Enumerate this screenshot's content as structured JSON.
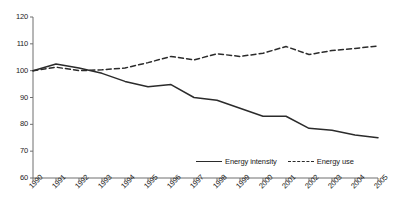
{
  "chart_data": {
    "type": "line",
    "title": "",
    "xlabel": "",
    "ylabel": "",
    "ylim": [
      60,
      120
    ],
    "ytick_values": [
      60,
      70,
      80,
      90,
      100,
      110,
      120
    ],
    "grid": false,
    "legend_position": "bottom-right",
    "categories": [
      "1990",
      "1991",
      "1992",
      "1993",
      "1994",
      "1995",
      "1996",
      "1997",
      "1998",
      "1999",
      "2000",
      "2001",
      "2002",
      "2003",
      "2004",
      "2005"
    ],
    "series": [
      {
        "name": "Energy intensity",
        "style": "solid",
        "color": "#2b2b2b",
        "values": [
          100,
          102.5,
          101,
          99,
          96,
          94,
          94.8,
          90,
          89,
          86,
          83,
          83,
          78.5,
          77.8,
          76,
          75
        ]
      },
      {
        "name": "Energy use",
        "style": "dashed",
        "color": "#2b2b2b",
        "values": [
          100,
          101.3,
          100,
          100.3,
          101,
          103,
          105.3,
          104,
          106.3,
          105.3,
          106.5,
          109,
          106,
          107.5,
          108.3,
          109.2
        ]
      }
    ]
  },
  "axes": {
    "y_labels": [
      "120",
      "110",
      "100",
      "90",
      "80",
      "70",
      "60"
    ],
    "x_labels": [
      "1990",
      "1991",
      "1992",
      "1993",
      "1994",
      "1995",
      "1996",
      "1997",
      "1998",
      "1999",
      "2000",
      "2001",
      "2002",
      "2003",
      "2004",
      "2005"
    ]
  },
  "legend": {
    "items": [
      {
        "label": "Energy intensity",
        "style": "solid"
      },
      {
        "label": "Energy use",
        "style": "dashed"
      }
    ]
  }
}
